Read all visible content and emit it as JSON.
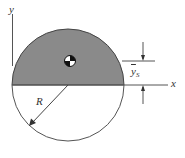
{
  "diagram": {
    "labels": {
      "x_axis": "x",
      "y_axis": "y",
      "radius": "R",
      "centroid_dim_main": "y",
      "centroid_dim_sub": "S"
    },
    "colors": {
      "shaded_region": "#8a8a8a",
      "outline": "#444444",
      "background": "#ffffff"
    },
    "geometry": {
      "circle_center": [
        68,
        85
      ],
      "radius_px": 56,
      "shaded": "upper half",
      "centroid_marker": [
        70,
        61
      ]
    }
  }
}
